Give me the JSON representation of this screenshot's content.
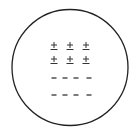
{
  "diagram": {
    "circle": {
      "cx": 70,
      "cy": 67.5,
      "r": 58,
      "stroke": "#222222",
      "stroke_width": 1.3
    },
    "symbol_color": "#333333",
    "rows": [
      {
        "type": "plus-minus",
        "y": 46,
        "items": [
          {
            "x": 54,
            "label": "±"
          },
          {
            "x": 70,
            "label": "±"
          },
          {
            "x": 86,
            "label": "±"
          }
        ]
      },
      {
        "type": "plus-minus",
        "y": 60,
        "items": [
          {
            "x": 54,
            "label": "±"
          },
          {
            "x": 70,
            "label": "±"
          },
          {
            "x": 86,
            "label": "±"
          }
        ]
      },
      {
        "type": "minus",
        "y": 78,
        "items": [
          {
            "x": 54,
            "label": "-"
          },
          {
            "x": 65,
            "label": "-"
          },
          {
            "x": 76,
            "label": "-"
          },
          {
            "x": 89,
            "label": "-"
          }
        ]
      },
      {
        "type": "minus",
        "y": 95,
        "items": [
          {
            "x": 54,
            "label": "-"
          },
          {
            "x": 65,
            "label": "-"
          },
          {
            "x": 76,
            "label": "-"
          },
          {
            "x": 89,
            "label": "-"
          }
        ]
      }
    ]
  }
}
